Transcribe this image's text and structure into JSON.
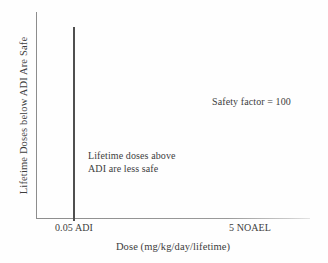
{
  "chart_data": {
    "type": "line",
    "title": "",
    "xlabel": "Dose (mg/kg/day/lifetime)",
    "ylabel": "Lifetime Doses below ADI Are Safe",
    "grid": false,
    "legend": "none",
    "x_tick_labels": [
      "0.05 ADI",
      "5 NOAEL"
    ],
    "x_tick_positions": [
      0.05,
      5
    ],
    "y_tick_labels": [],
    "xlim": [
      0,
      7.6
    ],
    "ylim": [
      0,
      1
    ],
    "series": [
      {
        "name": "ADI threshold",
        "type": "vertical-line",
        "x": 0.05,
        "y_from": 0,
        "y_to": 0.93,
        "color": "#4f4f4f"
      }
    ],
    "annotations": [
      {
        "name": "safety-factor",
        "text": "Safety factor = 100",
        "x": 5.0,
        "y": 0.58
      },
      {
        "name": "above-adi-note",
        "lines": [
          "Lifetime doses above",
          "ADI are less safe"
        ],
        "x": 1.5,
        "y": 0.33
      }
    ]
  },
  "axes": {
    "y_title": "Lifetime Doses below ADI Are Safe",
    "x_title": "Dose (mg/kg/day/lifetime)",
    "x_ticks": {
      "adi": "0.05 ADI",
      "noael": "5 NOAEL"
    },
    "axis_color": "#8d8d8d"
  },
  "annotations": {
    "safety_factor": "Safety factor = 100",
    "above_adi_line1": "Lifetime doses above",
    "above_adi_line2": "ADI are less safe"
  },
  "colors": {
    "background": "#fefefe",
    "axis": "#8d8d8d",
    "threshold_line": "#4f4f4f",
    "text": "#3d3d3d"
  }
}
